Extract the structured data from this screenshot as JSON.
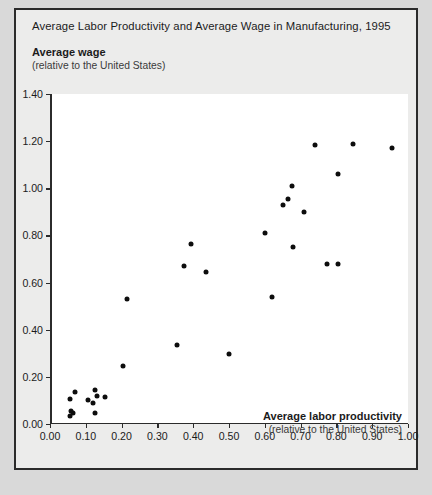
{
  "figure": {
    "title": "Average Labor Productivity and Average Wage in Manufacturing, 1995",
    "caption": ""
  },
  "chart_data": {
    "type": "scatter",
    "title": "Average Labor Productivity and Average Wage in Manufacturing, 1995",
    "xlabel": "Average labor productivity",
    "xlabel_sub": "(relative to the United States)",
    "ylabel": "Average wage",
    "ylabel_sub": "(relative to the United States)",
    "xlim": [
      0.0,
      1.0
    ],
    "ylim": [
      0.0,
      1.4
    ],
    "grid": false,
    "legend": null,
    "xticks": [
      "0.00",
      "0.10",
      "0.20",
      "0.30",
      "0.40",
      "0.50",
      "0.60",
      "0.70",
      "0.80",
      "0.90",
      "1.00"
    ],
    "xtick_values": [
      0.0,
      0.1,
      0.2,
      0.3,
      0.4,
      0.5,
      0.6,
      0.7,
      0.8,
      0.9,
      1.0
    ],
    "yticks": [
      "0.00",
      "0.20",
      "0.40",
      "0.60",
      "0.80",
      "1.00",
      "1.20",
      "1.40"
    ],
    "ytick_values": [
      0.0,
      0.2,
      0.4,
      0.6,
      0.8,
      1.0,
      1.2,
      1.4
    ],
    "marker": "circle",
    "marker_color": "#0d0d0d",
    "points": [
      {
        "x": 0.055,
        "y": 0.035
      },
      {
        "x": 0.065,
        "y": 0.045
      },
      {
        "x": 0.06,
        "y": 0.055
      },
      {
        "x": 0.125,
        "y": 0.045
      },
      {
        "x": 0.055,
        "y": 0.105
      },
      {
        "x": 0.07,
        "y": 0.135
      },
      {
        "x": 0.105,
        "y": 0.1
      },
      {
        "x": 0.12,
        "y": 0.09
      },
      {
        "x": 0.125,
        "y": 0.145
      },
      {
        "x": 0.13,
        "y": 0.12
      },
      {
        "x": 0.155,
        "y": 0.115
      },
      {
        "x": 0.205,
        "y": 0.245
      },
      {
        "x": 0.215,
        "y": 0.53
      },
      {
        "x": 0.355,
        "y": 0.335
      },
      {
        "x": 0.375,
        "y": 0.67
      },
      {
        "x": 0.395,
        "y": 0.765
      },
      {
        "x": 0.435,
        "y": 0.645
      },
      {
        "x": 0.5,
        "y": 0.295
      },
      {
        "x": 0.6,
        "y": 0.81
      },
      {
        "x": 0.62,
        "y": 0.54
      },
      {
        "x": 0.65,
        "y": 0.93
      },
      {
        "x": 0.665,
        "y": 0.955
      },
      {
        "x": 0.675,
        "y": 1.01
      },
      {
        "x": 0.68,
        "y": 0.75
      },
      {
        "x": 0.71,
        "y": 0.9
      },
      {
        "x": 0.74,
        "y": 1.185
      },
      {
        "x": 0.775,
        "y": 0.68
      },
      {
        "x": 0.805,
        "y": 0.68
      },
      {
        "x": 0.805,
        "y": 1.06
      },
      {
        "x": 0.845,
        "y": 1.19
      },
      {
        "x": 0.955,
        "y": 1.17
      }
    ]
  }
}
